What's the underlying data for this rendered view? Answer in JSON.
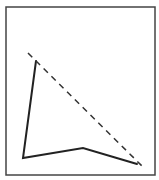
{
  "diagram": {
    "type": "line-figure",
    "canvas": {
      "width": 159,
      "height": 180
    },
    "frame": {
      "x": 6,
      "y": 7,
      "width": 149,
      "height": 168,
      "stroke": "#444444",
      "stroke_width": 1.5
    },
    "solid_polyline": {
      "points": [
        [
          36,
          61
        ],
        [
          23,
          158
        ],
        [
          83,
          148
        ],
        [
          137,
          164
        ]
      ],
      "stroke": "#222222",
      "stroke_width": 2
    },
    "dashed_line": {
      "from": [
        28,
        53
      ],
      "to": [
        143,
        167
      ],
      "stroke": "#333333",
      "stroke_width": 1.5,
      "dasharray": "6,5"
    }
  }
}
